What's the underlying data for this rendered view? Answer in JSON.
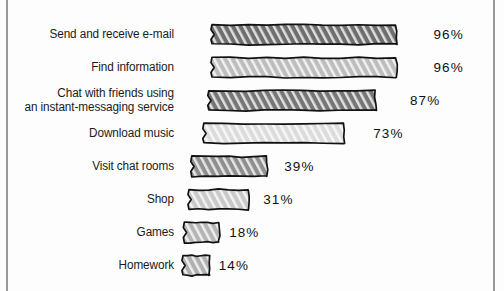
{
  "chart_data": {
    "type": "bar",
    "orientation": "horizontal",
    "title": "",
    "subtitle": "",
    "xlabel": "",
    "ylabel": "",
    "xlim": [
      0,
      100
    ],
    "grid": false,
    "legend": false,
    "value_suffix": "%",
    "categories": [
      "Send and receive e-mail",
      "Find information",
      "Chat with friends using an instant-messaging service",
      "Download music",
      "Visit chat rooms",
      "Shop",
      "Games",
      "Homework"
    ],
    "values": [
      96,
      96,
      87,
      73,
      39,
      31,
      18,
      14
    ],
    "value_labels": [
      "96%",
      "96%",
      "87%",
      "73%",
      "39%",
      "31%",
      "18%",
      "14%"
    ],
    "bars": [
      {
        "label_line1": "Send and receive e-mail",
        "label_line2": "",
        "value": 96,
        "value_label": "96%",
        "fill": "#6e6e6e"
      },
      {
        "label_line1": "Find information",
        "label_line2": "",
        "value": 96,
        "value_label": "96%",
        "fill": "#bdbdbd"
      },
      {
        "label_line1": "Chat with friends using",
        "label_line2": "an instant-messaging service",
        "value": 87,
        "value_label": "87%",
        "fill": "#767676"
      },
      {
        "label_line1": "Download music",
        "label_line2": "",
        "value": 73,
        "value_label": "73%",
        "fill": "#dcdcdc"
      },
      {
        "label_line1": "Visit chat rooms",
        "label_line2": "",
        "value": 39,
        "value_label": "39%",
        "fill": "#8f8f8f"
      },
      {
        "label_line1": "Shop",
        "label_line2": "",
        "value": 31,
        "value_label": "31%",
        "fill": "#c9c9c9"
      },
      {
        "label_line1": "Games",
        "label_line2": "",
        "value": 18,
        "value_label": "18%",
        "fill": "#b5b5b5"
      },
      {
        "label_line1": "Homework",
        "label_line2": "",
        "value": 14,
        "value_label": "14%",
        "fill": "#b0b0b0"
      }
    ]
  },
  "style": {
    "background": "#fdfdfd",
    "frame_color": "#9a9a9a",
    "outline_color": "#111111",
    "text_color": "#1a1a1a",
    "hatch_color": "#ffffff"
  }
}
